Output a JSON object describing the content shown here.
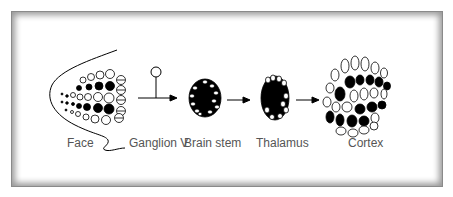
{
  "diagram": {
    "type": "pathway",
    "stages": [
      {
        "id": "face",
        "label": "Face"
      },
      {
        "id": "ganglion",
        "label": "Ganglion V"
      },
      {
        "id": "brainstem",
        "label": "Brain stem"
      },
      {
        "id": "thalamus",
        "label": "Thalamus"
      },
      {
        "id": "cortex",
        "label": "Cortex"
      }
    ],
    "colors": {
      "frame": "#8a8a8a",
      "ink": "#000000",
      "label": "#555555",
      "background": "#ffffff"
    }
  }
}
